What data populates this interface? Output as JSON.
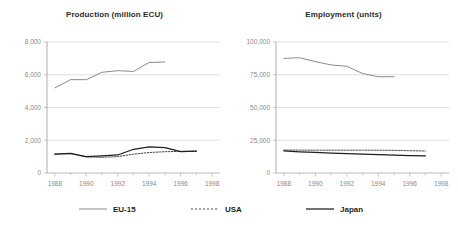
{
  "chart_data": [
    {
      "type": "line",
      "title": "Production (million ECU)",
      "xlabel": "",
      "ylabel": "",
      "xlim": [
        1987.5,
        1998.5
      ],
      "ylim": [
        0,
        8000
      ],
      "yticks": [
        0,
        2000,
        4000,
        6000,
        8000
      ],
      "ytick_labels": [
        "0",
        "2,000",
        "4,000",
        "6,000",
        "8,000"
      ],
      "xticks": [
        1988,
        1989,
        1990,
        1991,
        1992,
        1993,
        1994,
        1995,
        1996,
        1997,
        1998
      ],
      "xtick_labels": [
        "1988",
        "",
        "1990",
        "",
        "1992",
        "",
        "1994",
        "",
        "1996",
        "",
        "1998"
      ],
      "grid": true,
      "legend_position": "bottom",
      "series": [
        {
          "name": "EU-15",
          "style": "solid-thin",
          "color": "#7d7d7d",
          "x": [
            1988,
            1989,
            1990,
            1991,
            1992,
            1993,
            1994,
            1995
          ],
          "values": [
            5200,
            5700,
            5700,
            6150,
            6250,
            6200,
            6750,
            6780
          ]
        },
        {
          "name": "USA",
          "style": "dashed",
          "color": "#4a4a4a",
          "x": [
            1988,
            1989,
            1990,
            1991,
            1992,
            1993,
            1994,
            1995,
            1996,
            1997
          ],
          "values": [
            1150,
            1180,
            980,
            960,
            1000,
            1150,
            1250,
            1300,
            1320,
            1330
          ]
        },
        {
          "name": "Japan",
          "style": "solid-thick",
          "color": "#1f1f1f",
          "x": [
            1988,
            1989,
            1990,
            1991,
            1992,
            1993,
            1994,
            1995,
            1996,
            1997
          ],
          "values": [
            1150,
            1200,
            1000,
            1050,
            1100,
            1450,
            1600,
            1550,
            1300,
            1330
          ]
        }
      ]
    },
    {
      "type": "line",
      "title": "Employment (units)",
      "xlabel": "",
      "ylabel": "",
      "xlim": [
        1987.5,
        1998.5
      ],
      "ylim": [
        0,
        100000
      ],
      "yticks": [
        0,
        25000,
        50000,
        75000,
        100000
      ],
      "ytick_labels": [
        "0",
        "25,000",
        "50,000",
        "75,000",
        "100,000"
      ],
      "xticks": [
        1988,
        1989,
        1990,
        1991,
        1992,
        1993,
        1994,
        1995,
        1996,
        1997,
        1998
      ],
      "xtick_labels": [
        "1988",
        "",
        "1990",
        "",
        "1992",
        "",
        "1994",
        "",
        "1996",
        "",
        "1998"
      ],
      "grid": true,
      "legend_position": "bottom",
      "series": [
        {
          "name": "EU-15",
          "style": "solid-thin",
          "color": "#7d7d7d",
          "x": [
            1988,
            1989,
            1990,
            1991,
            1992,
            1993,
            1994,
            1995
          ],
          "values": [
            87500,
            88000,
            85000,
            82500,
            81500,
            76000,
            73500,
            73500
          ]
        },
        {
          "name": "USA",
          "style": "dashed",
          "color": "#4a4a4a",
          "x": [
            1988,
            1989,
            1990,
            1991,
            1992,
            1993,
            1994,
            1995,
            1996,
            1997
          ],
          "values": [
            17500,
            17500,
            17400,
            17400,
            17400,
            17400,
            17400,
            17300,
            17000,
            16800
          ]
        },
        {
          "name": "Japan",
          "style": "solid-thick",
          "color": "#1f1f1f",
          "x": [
            1988,
            1989,
            1990,
            1991,
            1992,
            1993,
            1994,
            1995,
            1996,
            1997
          ],
          "values": [
            16800,
            16200,
            15700,
            15200,
            14800,
            14400,
            14000,
            13600,
            13300,
            13000
          ]
        }
      ]
    }
  ],
  "legend": {
    "items": [
      {
        "label": "EU-15",
        "style": "solid-thin",
        "color": "#7d7d7d"
      },
      {
        "label": "USA",
        "style": "dashed",
        "color": "#4a4a4a"
      },
      {
        "label": "Japan",
        "style": "solid-thick",
        "color": "#1f1f1f"
      }
    ]
  }
}
